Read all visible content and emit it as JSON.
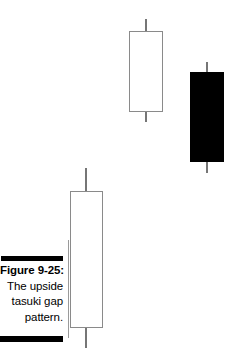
{
  "figure": {
    "caption_lines": [
      "Figure 9-25:",
      "The upside",
      "tasuki gap",
      "pattern."
    ],
    "caption_label": "Figure 9-25:",
    "caption_body": "The upside tasuki gap pattern.",
    "rule_color": "#000000",
    "divider_color": "#9a9a9a"
  },
  "chart_data": {
    "type": "candlestick",
    "title": "The upside tasuki gap pattern.",
    "xlabel": "",
    "ylabel": "",
    "grid": false,
    "legend": "none",
    "axis_visible": false,
    "price_axis_note": "Unlabeled schematic axes; values are relative positions in pixels from the top of the figure.",
    "candles": [
      {
        "index": 1,
        "name": "first-white-candle",
        "direction": "bullish",
        "fill": "hollow",
        "body_color": "#ffffff",
        "border_color": "#8a8a8a",
        "wick_color": "#767676",
        "px": {
          "left": 70,
          "right": 103,
          "body_top": 191,
          "body_bottom": 328,
          "wick_top": 168,
          "wick_bottom": 348,
          "center_x": 86
        }
      },
      {
        "index": 2,
        "name": "second-white-candle",
        "direction": "bullish",
        "fill": "hollow",
        "body_color": "#ffffff",
        "border_color": "#8a8a8a",
        "wick_color": "#767676",
        "px": {
          "left": 129,
          "right": 163,
          "body_top": 31,
          "body_bottom": 112,
          "wick_top": 19,
          "wick_bottom": 122,
          "center_x": 146
        }
      },
      {
        "index": 3,
        "name": "third-black-candle",
        "direction": "bearish",
        "fill": "filled",
        "body_color": "#000000",
        "border_color": "#000000",
        "wick_color": "#767676",
        "px": {
          "left": 190,
          "right": 224,
          "body_top": 72,
          "body_bottom": 162,
          "wick_top": 62,
          "wick_bottom": 173,
          "center_x": 207
        }
      }
    ]
  }
}
